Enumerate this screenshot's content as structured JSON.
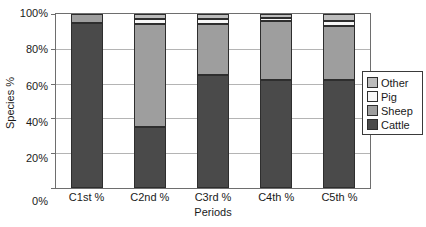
{
  "chart_data": {
    "type": "bar",
    "subtype": "stacked-percentage",
    "title": "",
    "xlabel": "Periods",
    "ylabel": "Species %",
    "categories": [
      "C1st %",
      "C2nd %",
      "C3rd %",
      "C4th %",
      "C5th %"
    ],
    "series": [
      {
        "name": "Cattle",
        "color": "#4a4a4a",
        "values": [
          95,
          35,
          65,
          62,
          62
        ]
      },
      {
        "name": "Sheep",
        "color": "#9e9e9e",
        "values": [
          5,
          59,
          29,
          34,
          31
        ]
      },
      {
        "name": "Pig",
        "color": "#f7f7f7",
        "values": [
          0,
          3,
          3,
          2,
          3
        ]
      },
      {
        "name": "Other",
        "color": "#bcbcbc",
        "values": [
          0,
          3,
          3,
          2,
          4
        ]
      }
    ],
    "y_ticks": [
      "100%",
      "80%",
      "60%",
      "40%",
      "20%",
      "0%"
    ],
    "ylim": [
      0,
      100
    ],
    "grid": true,
    "grid_color": "#b4b4b4",
    "axis_color": "#6e6e6e",
    "legend": {
      "position": "right",
      "labels": [
        "Other",
        "Pig",
        "Sheep",
        "Cattle"
      ]
    }
  }
}
